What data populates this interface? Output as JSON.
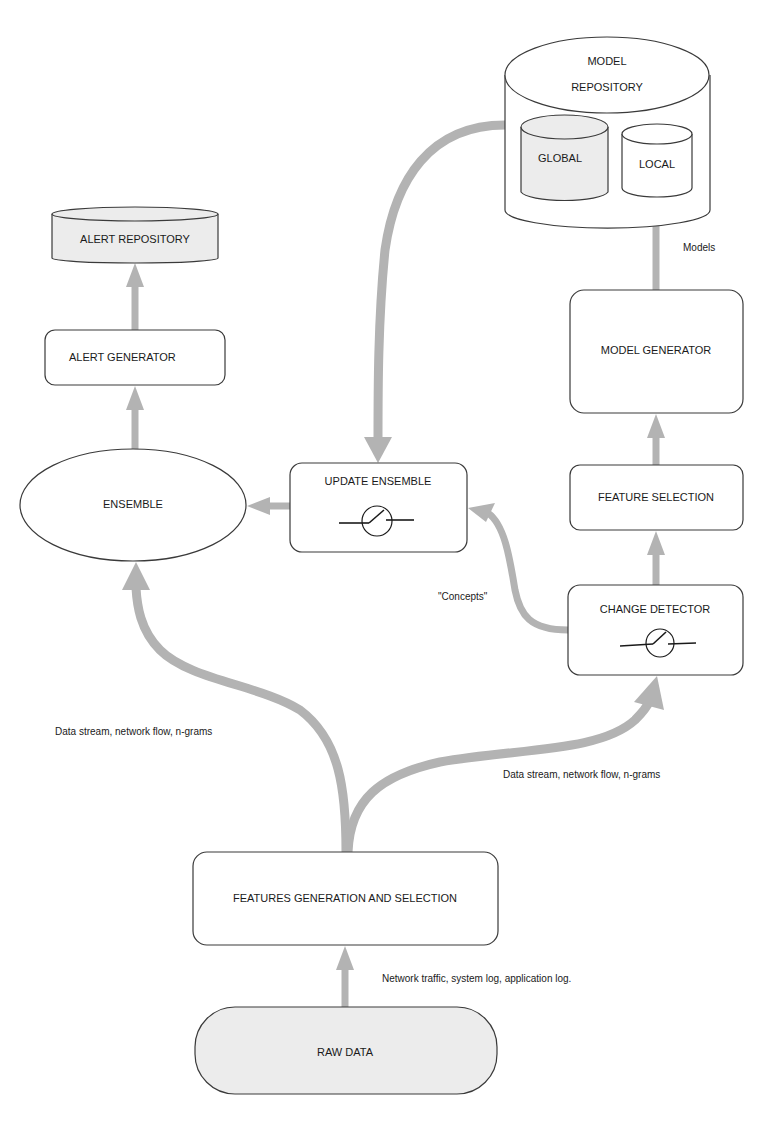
{
  "diagram": {
    "nodes": {
      "model_repository": {
        "line1": "MODEL",
        "line2": "REPOSITORY"
      },
      "global": {
        "label": "GLOBAL"
      },
      "local": {
        "label": "LOCAL"
      },
      "alert_repository": {
        "label": "ALERT REPOSITORY"
      },
      "alert_generator": {
        "label": "ALERT GENERATOR"
      },
      "ensemble": {
        "label": "ENSEMBLE"
      },
      "update_ensemble": {
        "label": "UPDATE ENSEMBLE"
      },
      "model_generator": {
        "label": "MODEL GENERATOR"
      },
      "feature_selection": {
        "label": "FEATURE SELECTION"
      },
      "change_detector": {
        "label": "CHANGE DETECTOR"
      },
      "features_generation": {
        "label": "FEATURES GENERATION AND SELECTION"
      },
      "raw_data": {
        "label": "RAW DATA"
      }
    },
    "edge_labels": {
      "models": "Models",
      "concepts": "\"Concepts\"",
      "stream_left": "Data stream, network flow, n-grams",
      "stream_right": "Data stream, network flow, n-grams",
      "raw_input": "Network traffic, system log, application log."
    },
    "colors": {
      "arrow": "#b3b3b3",
      "stroke": "#3a3a3a",
      "gray_fill": "#ececec",
      "text": "#1a1a1a"
    }
  }
}
